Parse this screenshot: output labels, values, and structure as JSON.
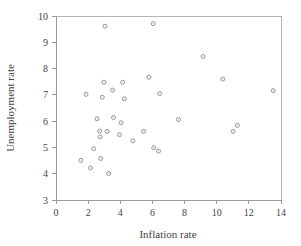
{
  "chart_data": {
    "type": "scatter",
    "title": "",
    "xlabel": "Inflation rate",
    "ylabel": "Unemployment rate",
    "xlim": [
      0,
      14
    ],
    "ylim": [
      3,
      10
    ],
    "xticks": [
      0,
      2,
      4,
      6,
      8,
      10,
      12,
      14
    ],
    "yticks": [
      3,
      4,
      5,
      6,
      7,
      8,
      9,
      10
    ],
    "grid": false,
    "legend": null,
    "marker": "open-circle",
    "point_color": "#8a8a8a",
    "axis_color": "#9a9a9a",
    "points": [
      {
        "x": 1.55,
        "y": 4.51
      },
      {
        "x": 1.87,
        "y": 7.02
      },
      {
        "x": 2.15,
        "y": 4.22
      },
      {
        "x": 2.35,
        "y": 4.95
      },
      {
        "x": 2.55,
        "y": 6.09
      },
      {
        "x": 2.72,
        "y": 5.62
      },
      {
        "x": 2.75,
        "y": 5.4
      },
      {
        "x": 2.78,
        "y": 4.58
      },
      {
        "x": 2.88,
        "y": 6.91
      },
      {
        "x": 2.98,
        "y": 7.48
      },
      {
        "x": 3.05,
        "y": 9.61
      },
      {
        "x": 3.18,
        "y": 5.61
      },
      {
        "x": 3.28,
        "y": 4.01
      },
      {
        "x": 3.52,
        "y": 7.18
      },
      {
        "x": 3.58,
        "y": 6.14
      },
      {
        "x": 3.95,
        "y": 5.49
      },
      {
        "x": 4.05,
        "y": 5.94
      },
      {
        "x": 4.15,
        "y": 7.48
      },
      {
        "x": 4.25,
        "y": 6.85
      },
      {
        "x": 4.78,
        "y": 5.25
      },
      {
        "x": 5.45,
        "y": 5.61
      },
      {
        "x": 5.78,
        "y": 7.67
      },
      {
        "x": 6.05,
        "y": 9.71
      },
      {
        "x": 6.08,
        "y": 4.99
      },
      {
        "x": 6.38,
        "y": 4.86
      },
      {
        "x": 6.45,
        "y": 7.05
      },
      {
        "x": 7.62,
        "y": 6.06
      },
      {
        "x": 9.15,
        "y": 8.46
      },
      {
        "x": 10.38,
        "y": 7.6
      },
      {
        "x": 11.02,
        "y": 5.61
      },
      {
        "x": 11.28,
        "y": 5.84
      },
      {
        "x": 13.52,
        "y": 7.16
      }
    ]
  },
  "axes": {
    "x_title": "Inflation rate",
    "y_title": "Unemployment rate",
    "x_tick_labels": [
      "0",
      "2",
      "4",
      "6",
      "8",
      "10",
      "12",
      "14"
    ],
    "y_tick_labels": [
      "3",
      "4",
      "5",
      "6",
      "7",
      "8",
      "9",
      "10"
    ]
  }
}
